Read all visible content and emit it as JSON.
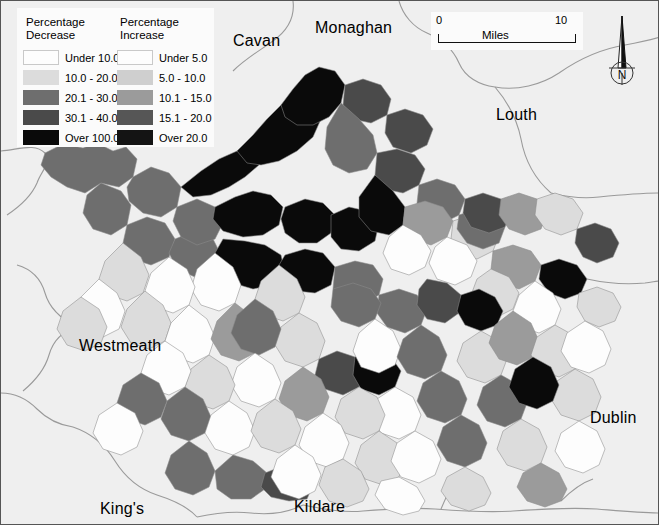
{
  "map": {
    "background_color": "#efefef",
    "border_color": "#555555",
    "boundary_line_color": "#9a9a9a",
    "place_labels": [
      {
        "name": "Cavan",
        "text": "Cavan",
        "x": 232,
        "y": 31
      },
      {
        "name": "Monaghan",
        "text": "Monaghan",
        "x": 314,
        "y": 18
      },
      {
        "name": "Louth",
        "text": "Louth",
        "x": 495,
        "y": 105
      },
      {
        "name": "Westmeath",
        "text": "Westmeath",
        "x": 78,
        "y": 336
      },
      {
        "name": "Dublin",
        "text": "Dublin",
        "x": 589,
        "y": 408
      },
      {
        "name": "Kings",
        "text": "King's",
        "x": 99,
        "y": 499
      },
      {
        "name": "Kildare",
        "text": "Kildare",
        "x": 293,
        "y": 497
      }
    ]
  },
  "legend": {
    "decrease": {
      "title_line1": "Percentage",
      "title_line2": "Decrease",
      "items": [
        {
          "label": "Under 10.0",
          "color": "#fdfdfd"
        },
        {
          "label": "10.0 - 20.0",
          "color": "#dcdcdc"
        },
        {
          "label": "20.1 - 30.0",
          "color": "#6e6e6e"
        },
        {
          "label": "30.1 - 40.0",
          "color": "#4a4a4a"
        },
        {
          "label": "Over 100.0",
          "color": "#0a0a0a"
        }
      ]
    },
    "increase": {
      "title_line1": "Percentage",
      "title_line2": "Increase",
      "items": [
        {
          "label": "Under  5.0",
          "color": "#fdfdfd"
        },
        {
          "label": "5.0 - 10.0",
          "color": "#cfcfcf"
        },
        {
          "label": "10.1 - 15.0",
          "color": "#9b9b9b"
        },
        {
          "label": "15.1 - 20.0",
          "color": "#565656"
        },
        {
          "label": "Over  20.0",
          "color": "#141414"
        }
      ]
    }
  },
  "scalebar": {
    "min": "0",
    "max": "10",
    "unit": "Miles"
  },
  "north_arrow": {
    "label": "N"
  },
  "chart_data": {
    "type": "choropleth",
    "title": "",
    "legend_position": "top-left",
    "classes_decrease": [
      "Under 10.0",
      "10.0 - 20.0",
      "20.1 - 30.0",
      "30.1 - 40.0",
      "Over 100.0"
    ],
    "classes_increase": [
      "Under  5.0",
      "5.0 - 10.0",
      "10.1 - 15.0",
      "15.1 - 20.0",
      "Over  20.0"
    ],
    "class_colors": [
      "#fdfdfd",
      "#dcdcdc",
      "#cfcfcf",
      "#9b9b9b",
      "#6e6e6e",
      "#565656",
      "#4a4a4a",
      "#141414",
      "#0a0a0a"
    ],
    "regions_labeled": [
      "Cavan",
      "Monaghan",
      "Louth",
      "Westmeath",
      "Dublin",
      "King's",
      "Kildare"
    ],
    "scale_max_miles": 10,
    "polygons": [
      {
        "c": "#6e6e6e",
        "p": "44,152 62,143 82,147 96,142 112,150 125,146 136,158 132,176 118,186 100,182 84,192 66,186 50,176 40,164"
      },
      {
        "c": "#6e6e6e",
        "p": "132,176 150,166 168,172 180,186 176,206 160,216 142,212 128,200 126,186"
      },
      {
        "c": "#6e6e6e",
        "p": "100,182 120,190 130,204 126,224 110,234 92,228 82,212 86,194"
      },
      {
        "c": "#6e6e6e",
        "p": "126,224 146,216 164,222 174,238 168,256 150,264 132,258 122,242"
      },
      {
        "c": "#6e6e6e",
        "p": "174,238 194,230 212,238 220,254 212,270 194,276 176,268 168,252"
      },
      {
        "c": "#6e6e6e",
        "p": "176,206 196,198 214,206 222,222 214,238 196,244 180,236 172,220"
      },
      {
        "c": "#0a0a0a",
        "p": "180,186 200,170 218,158 236,150 250,138 262,146 258,164 244,176 228,186 210,194 192,196"
      },
      {
        "c": "#0a0a0a",
        "p": "236,150 252,134 266,118 280,104 296,96 312,102 320,118 312,136 296,150 278,160 260,164 246,162"
      },
      {
        "c": "#0a0a0a",
        "p": "280,104 292,88 304,74 318,66 334,70 344,84 340,102 328,116 312,124 296,124 284,116"
      },
      {
        "c": "#0a0a0a",
        "p": "214,206 234,196 252,190 270,194 282,206 278,224 262,234 242,236 222,230 212,218"
      },
      {
        "c": "#0a0a0a",
        "p": "222,238 244,240 264,244 280,254 284,272 272,284 252,288 232,282 218,270 214,252"
      },
      {
        "c": "#0a0a0a",
        "p": "284,206 304,198 322,202 334,214 330,232 316,242 298,242 284,232 280,218"
      },
      {
        "c": "#0a0a0a",
        "p": "284,254 304,248 322,252 334,266 330,284 314,292 296,290 282,278 278,264"
      },
      {
        "c": "#0a0a0a",
        "p": "330,214 348,206 366,210 378,222 374,240 358,250 340,248 330,236"
      },
      {
        "c": "#6e6e6e",
        "p": "334,266 354,260 372,264 382,278 378,294 362,302 344,300 332,288"
      },
      {
        "c": "#4a4a4a",
        "p": "344,84 362,78 380,84 390,98 386,114 370,122 352,118 342,104"
      },
      {
        "c": "#4a4a4a",
        "p": "386,114 404,108 422,114 432,128 426,144 410,152 392,146 384,132"
      },
      {
        "c": "#6e6e6e",
        "p": "340,102 358,118 372,134 376,152 366,168 348,172 332,164 324,148 326,126"
      },
      {
        "c": "#4a4a4a",
        "p": "376,152 396,148 414,154 424,168 418,184 402,192 384,188 374,174"
      },
      {
        "c": "#6e6e6e",
        "p": "418,184 436,178 454,184 464,198 458,214 442,222 424,216 416,202"
      },
      {
        "c": "#0a0a0a",
        "p": "374,174 392,190 404,206 402,224 388,234 370,230 358,216 358,196"
      },
      {
        "c": "#9b9b9b",
        "p": "404,206 424,200 442,206 452,220 446,236 430,244 412,238 402,224"
      },
      {
        "c": "#dcdcdc",
        "p": "452,220 470,214 488,220 498,234 492,250 476,258 458,252 450,238"
      },
      {
        "c": "#6e6e6e",
        "p": "458,214 476,208 494,212 504,226 498,242 482,248 466,242 456,228"
      },
      {
        "c": "#4a4a4a",
        "p": "464,198 482,192 500,198 510,212 504,226 488,232 470,226 462,212"
      },
      {
        "c": "#9b9b9b",
        "p": "500,198 518,192 536,198 546,212 540,228 524,234 508,228 498,214"
      },
      {
        "c": "#dcdcdc",
        "p": "536,198 554,192 572,198 582,212 576,228 560,234 544,228 534,214"
      },
      {
        "c": "#9b9b9b",
        "p": "492,250 512,244 530,250 540,264 534,280 518,288 500,282 490,268"
      },
      {
        "c": "#0a0a0a",
        "p": "540,264 558,258 576,264 586,278 580,292 564,298 548,292 538,278"
      },
      {
        "c": "#4a4a4a",
        "p": "576,228 594,222 610,228 618,242 612,256 596,262 582,256 574,242"
      },
      {
        "c": "#dcdcdc",
        "p": "578,292 596,286 612,292 620,306 614,320 598,326 584,320 576,306"
      },
      {
        "c": "#fdfdfd",
        "p": "534,280 552,292 560,308 554,324 538,332 520,326 512,310 518,294"
      },
      {
        "c": "#dcdcdc",
        "p": "490,268 508,276 518,292 512,308 496,316 478,310 470,294 476,278"
      },
      {
        "c": "#fdfdfd",
        "p": "446,236 466,244 476,260 470,276 454,284 436,278 428,262 434,246"
      },
      {
        "c": "#fdfdfd",
        "p": "402,224 420,234 430,250 424,266 408,274 390,268 382,252 388,236"
      },
      {
        "c": "#6e6e6e",
        "p": "378,294 398,288 416,294 426,308 420,324 404,332 386,326 376,312"
      },
      {
        "c": "#4a4a4a",
        "p": "426,278 446,282 460,294 458,312 444,322 426,318 416,304 418,288"
      },
      {
        "c": "#0a0a0a",
        "p": "460,294 478,288 494,296 502,310 496,324 480,330 464,324 456,310"
      },
      {
        "c": "#6e6e6e",
        "p": "332,288 352,282 370,288 380,302 374,318 358,326 340,320 330,306"
      },
      {
        "c": "#dcdcdc",
        "p": "278,264 296,278 304,296 298,312 282,320 264,314 254,298 260,280"
      },
      {
        "c": "#fdfdfd",
        "p": "214,252 232,266 240,284 234,302 218,310 200,304 190,288 196,268"
      },
      {
        "c": "#fdfdfd",
        "p": "168,256 186,268 194,286 188,304 172,312 154,306 144,290 150,272"
      },
      {
        "c": "#dcdcdc",
        "p": "122,242 140,256 148,274 142,292 126,300 108,294 98,278 104,260"
      },
      {
        "c": "#fdfdfd",
        "p": "98,278 116,292 124,310 118,328 102,336 84,330 74,314 80,296"
      },
      {
        "c": "#dcdcdc",
        "p": "144,290 162,304 170,322 164,340 148,348 130,342 120,326 126,308"
      },
      {
        "c": "#fdfdfd",
        "p": "188,304 206,318 214,336 208,354 192,362 174,356 164,340 170,322"
      },
      {
        "c": "#9b9b9b",
        "p": "234,302 252,316 260,334 254,352 238,360 220,354 210,338 216,320"
      },
      {
        "c": "#dcdcdc",
        "p": "298,312 316,322 324,340 318,358 302,366 284,360 274,344 280,326"
      },
      {
        "c": "#6e6e6e",
        "p": "254,298 272,310 280,328 274,346 258,354 240,348 230,332 236,314"
      },
      {
        "c": "#4a4a4a",
        "p": "318,358 336,350 354,356 364,370 358,386 342,394 324,388 314,374"
      },
      {
        "c": "#0a0a0a",
        "p": "354,356 372,350 390,356 400,370 394,386 378,394 360,388 352,374"
      },
      {
        "c": "#fdfdfd",
        "p": "374,318 392,330 400,348 394,364 378,372 360,366 352,350 358,332"
      },
      {
        "c": "#6e6e6e",
        "p": "420,324 438,336 446,354 440,370 424,378 406,372 396,356 402,338"
      },
      {
        "c": "#dcdcdc",
        "p": "480,330 498,340 506,358 500,374 484,382 466,376 456,360 462,342"
      },
      {
        "c": "#9b9b9b",
        "p": "512,310 530,322 538,340 532,356 516,364 498,358 488,342 494,324"
      },
      {
        "c": "#dcdcdc",
        "p": "554,324 572,334 580,352 574,368 558,376 540,370 530,354 536,336"
      },
      {
        "c": "#fdfdfd",
        "p": "584,320 602,330 610,348 604,364 588,372 570,366 560,350 566,332"
      },
      {
        "c": "#6e6e6e",
        "p": "440,370 458,380 466,398 460,414 444,422 426,416 416,400 422,382"
      },
      {
        "c": "#6e6e6e",
        "p": "500,374 518,384 526,402 520,418 504,426 486,420 476,404 482,386"
      },
      {
        "c": "#dcdcdc",
        "p": "574,368 592,378 600,396 594,412 578,420 560,414 550,398 556,380"
      },
      {
        "c": "#0a0a0a",
        "p": "532,356 550,366 558,384 552,400 536,408 518,402 508,386 514,368"
      },
      {
        "c": "#fdfdfd",
        "p": "394,386 412,396 420,414 414,430 398,438 380,432 370,416 376,398"
      },
      {
        "c": "#dcdcdc",
        "p": "358,386 376,396 384,414 378,430 362,438 344,432 334,416 340,398"
      },
      {
        "c": "#9b9b9b",
        "p": "302,366 320,378 328,396 322,412 306,420 288,414 278,398 284,380"
      },
      {
        "c": "#fdfdfd",
        "p": "254,352 272,364 280,382 274,398 258,406 240,400 230,384 236,366"
      },
      {
        "c": "#dcdcdc",
        "p": "208,354 226,366 234,384 228,400 212,408 194,402 184,386 190,368"
      },
      {
        "c": "#fdfdfd",
        "p": "164,340 182,352 190,370 184,386 168,394 150,388 140,372 146,354"
      },
      {
        "c": "#6e6e6e",
        "p": "184,386 202,398 210,416 204,432 188,440 170,434 160,418 166,400"
      },
      {
        "c": "#fdfdfd",
        "p": "228,400 246,412 254,430 248,446 232,454 214,448 204,432 210,414"
      },
      {
        "c": "#dcdcdc",
        "p": "274,398 292,410 300,428 294,444 278,452 260,446 250,430 256,412"
      },
      {
        "c": "#fdfdfd",
        "p": "322,412 340,424 348,442 342,458 326,466 308,460 298,444 304,426"
      },
      {
        "c": "#dcdcdc",
        "p": "378,430 396,442 404,460 398,476 382,484 364,478 354,462 360,444"
      },
      {
        "c": "#fdfdfd",
        "p": "414,430 432,440 440,458 434,474 418,482 400,476 390,460 396,442"
      },
      {
        "c": "#6e6e6e",
        "p": "460,414 478,424 486,442 480,458 464,466 446,460 436,444 442,426"
      },
      {
        "c": "#dcdcdc",
        "p": "520,418 538,428 546,446 540,462 524,470 506,464 496,448 502,430"
      },
      {
        "c": "#fdfdfd",
        "p": "578,420 596,430 604,448 598,464 582,472 564,466 554,450 560,432"
      },
      {
        "c": "#6e6e6e",
        "p": "188,440 206,452 214,470 208,486 192,494 174,488 164,472 170,454"
      },
      {
        "c": "#6e6e6e",
        "p": "232,454 252,460 266,472 264,488 250,498 230,498 216,488 214,470"
      },
      {
        "c": "#4a4a4a",
        "p": "264,472 284,464 302,470 312,484 306,498 288,500 270,496 260,486"
      },
      {
        "c": "#fdfdfd",
        "p": "294,444 312,456 320,474 314,490 298,498 280,492 270,476 276,458"
      },
      {
        "c": "#dcdcdc",
        "p": "342,458 360,470 368,488 362,500 346,506 328,500 318,484 324,466"
      },
      {
        "c": "#fdfdfd",
        "p": "398,476 416,486 424,500 418,510 402,514 384,508 374,494 380,480"
      },
      {
        "c": "#dcdcdc",
        "p": "464,466 482,476 490,492 484,504 468,510 450,504 440,490 446,476"
      },
      {
        "c": "#9b9b9b",
        "p": "540,462 558,472 566,488 560,500 544,506 526,500 516,486 522,472"
      },
      {
        "c": "#6e6e6e",
        "p": "140,372 158,382 166,400 160,416 144,424 126,418 116,402 122,384"
      },
      {
        "c": "#fdfdfd",
        "p": "116,402 134,412 142,430 136,446 120,454 102,448 92,432 98,414"
      },
      {
        "c": "#dcdcdc",
        "p": "80,296 98,308 106,326 100,342 84,350 66,344 56,328 62,310"
      }
    ]
  }
}
